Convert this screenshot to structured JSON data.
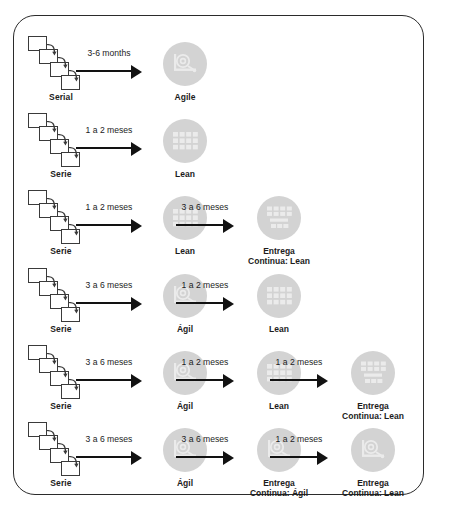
{
  "diagram": {
    "frame_border_color": "#2b2b2b",
    "bubble_color": "#d3d3d3",
    "arrow_color": "#121212",
    "text_color": "#1c1c1c",
    "rows": [
      {
        "source": {
          "label": "Serial",
          "icon": "cascading-squares-icon"
        },
        "steps": [
          {
            "duration": "3-6 months",
            "node": {
              "label": "Agile",
              "icon": "agile-gear-icon"
            }
          }
        ]
      },
      {
        "source": {
          "label": "Serie",
          "icon": "cascading-squares-icon"
        },
        "steps": [
          {
            "duration": "1 a 2 meses",
            "node": {
              "label": "Lean",
              "icon": "kanban-board-icon"
            }
          }
        ]
      },
      {
        "source": {
          "label": "Serie",
          "icon": "cascading-squares-icon"
        },
        "steps": [
          {
            "duration": "1 a 2 meses",
            "node": {
              "label": "Lean",
              "icon": "kanban-board-icon"
            }
          },
          {
            "duration": "3 a 6 meses",
            "node": {
              "label": "Entrega\nContinua: Lean",
              "icon": "continuous-delivery-lean-icon"
            }
          }
        ]
      },
      {
        "source": {
          "label": "Serie",
          "icon": "cascading-squares-icon"
        },
        "steps": [
          {
            "duration": "3 a 6 meses",
            "node": {
              "label": "Ágil",
              "icon": "agile-gear-icon"
            }
          },
          {
            "duration": "1 a 2 meses",
            "node": {
              "label": "Lean",
              "icon": "kanban-board-icon"
            }
          }
        ]
      },
      {
        "source": {
          "label": "Serie",
          "icon": "cascading-squares-icon"
        },
        "steps": [
          {
            "duration": "3 a 6 meses",
            "node": {
              "label": "Ágil",
              "icon": "agile-gear-icon"
            }
          },
          {
            "duration": "1 a 2 meses",
            "node": {
              "label": "Lean",
              "icon": "kanban-board-icon"
            }
          },
          {
            "duration": "1 a 2 meses",
            "node": {
              "label": "Entrega\nContinua: Lean",
              "icon": "continuous-delivery-lean-icon"
            }
          }
        ]
      },
      {
        "source": {
          "label": "Serie",
          "icon": "cascading-squares-icon"
        },
        "steps": [
          {
            "duration": "3 a 6 meses",
            "node": {
              "label": "Ágil",
              "icon": "agile-gear-icon"
            }
          },
          {
            "duration": "3 a 6 meses",
            "node": {
              "label": "Entrega\nContinua: Ágil",
              "icon": "continuous-delivery-agile-icon"
            }
          },
          {
            "duration": "1 a 2 meses",
            "node": {
              "label": "Entrega\nContinua: Lean",
              "icon": "continuous-delivery-agile-icon"
            }
          }
        ]
      }
    ]
  }
}
